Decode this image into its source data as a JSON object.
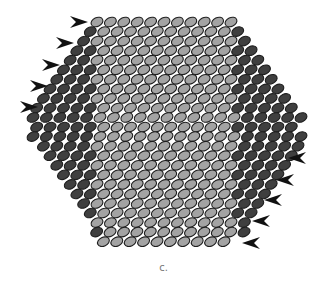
{
  "figure": {
    "caption": "c.",
    "colors": {
      "light_fill": "#a3a3a3",
      "dark_fill": "#3f3f3f",
      "outline": "#1e1e1e",
      "arrow": "#111111",
      "caption": "#777777"
    },
    "lattice": {
      "row_count": 24,
      "row_pitch_y": 9.55,
      "col_pitch_x": 13.4,
      "top_row_y": 22,
      "ellipse_rx": 6.2,
      "ellipse_ry": 4.4,
      "tilt_deg": -25,
      "rows": [
        {
          "start": 97.0,
          "dark_left": 0,
          "light": 11,
          "dark_right": 0
        },
        {
          "start": 90.3,
          "dark_left": 1,
          "light": 10,
          "dark_right": 1
        },
        {
          "start": 83.6,
          "dark_left": 1,
          "light": 11,
          "dark_right": 1
        },
        {
          "start": 76.9,
          "dark_left": 2,
          "light": 10,
          "dark_right": 2
        },
        {
          "start": 70.2,
          "dark_left": 2,
          "light": 11,
          "dark_right": 2
        },
        {
          "start": 63.5,
          "dark_left": 3,
          "light": 10,
          "dark_right": 3
        },
        {
          "start": 56.8,
          "dark_left": 3,
          "light": 11,
          "dark_right": 3
        },
        {
          "start": 50.1,
          "dark_left": 4,
          "light": 10,
          "dark_right": 4
        },
        {
          "start": 43.4,
          "dark_left": 4,
          "light": 11,
          "dark_right": 4
        },
        {
          "start": 36.7,
          "dark_left": 5,
          "light": 10,
          "dark_right": 5
        },
        {
          "start": 33.0,
          "dark_left": 5,
          "light": 11,
          "dark_right": 5
        },
        {
          "start": 36.7,
          "dark_left": 5,
          "light": 10,
          "dark_right": 5
        },
        {
          "start": 33.0,
          "dark_left": 5,
          "light": 11,
          "dark_right": 5
        },
        {
          "start": 43.4,
          "dark_left": 4,
          "light": 11,
          "dark_right": 5
        },
        {
          "start": 50.1,
          "dark_left": 4,
          "light": 10,
          "dark_right": 5
        },
        {
          "start": 56.8,
          "dark_left": 3,
          "light": 11,
          "dark_right": 4
        },
        {
          "start": 63.5,
          "dark_left": 3,
          "light": 10,
          "dark_right": 4
        },
        {
          "start": 70.2,
          "dark_left": 2,
          "light": 11,
          "dark_right": 3
        },
        {
          "start": 76.9,
          "dark_left": 2,
          "light": 10,
          "dark_right": 3
        },
        {
          "start": 83.6,
          "dark_left": 1,
          "light": 11,
          "dark_right": 2
        },
        {
          "start": 90.3,
          "dark_left": 1,
          "light": 10,
          "dark_right": 2
        },
        {
          "start": 97.0,
          "dark_left": 0,
          "light": 11,
          "dark_right": 1
        },
        {
          "start": 96.7,
          "dark_left": 1,
          "light": 10,
          "dark_right": 1
        },
        {
          "start": 103.4,
          "dark_left": 0,
          "light": 10,
          "dark_right": 0
        }
      ]
    },
    "arrows_left": [
      {
        "x": 80,
        "y": 22,
        "direction": "right"
      },
      {
        "x": 66,
        "y": 43,
        "direction": "right"
      },
      {
        "x": 52,
        "y": 65,
        "direction": "right"
      },
      {
        "x": 40,
        "y": 86,
        "direction": "right"
      },
      {
        "x": 30,
        "y": 107,
        "direction": "right"
      }
    ],
    "arrows_right": [
      {
        "x": 296,
        "y": 158,
        "direction": "left"
      },
      {
        "x": 284,
        "y": 180,
        "direction": "left"
      },
      {
        "x": 272,
        "y": 200,
        "direction": "left"
      },
      {
        "x": 260,
        "y": 221,
        "direction": "left"
      },
      {
        "x": 250,
        "y": 243,
        "direction": "left"
      }
    ]
  }
}
